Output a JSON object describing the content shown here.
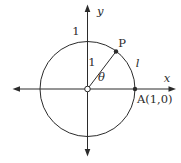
{
  "figure": {
    "description_colors": {
      "stroke": "#2b2b2b",
      "background": "#ffffff"
    },
    "labels": {
      "y_axis": "y",
      "x_axis": "x",
      "unit_on_circle_top": "1",
      "radius": "1",
      "point_p": "P",
      "arc_length": "l",
      "angle_theta": "θ",
      "point_a": "A(1,0)"
    }
  }
}
